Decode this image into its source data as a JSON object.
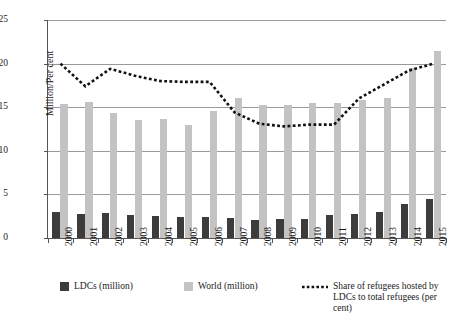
{
  "chart_data": {
    "type": "bar",
    "title": "",
    "xlabel": "",
    "ylabel": "Million/Per cent",
    "ylim": [
      0,
      25
    ],
    "yticks": [
      0,
      5,
      10,
      15,
      20,
      25
    ],
    "grid": true,
    "legend_position": "bottom",
    "categories": [
      "2000",
      "2001",
      "2002",
      "2003",
      "2004",
      "2005",
      "2006",
      "2007",
      "2008",
      "2009",
      "2010",
      "2011",
      "2012",
      "2013",
      "2014",
      "2015"
    ],
    "series": [
      {
        "name": "LDCs (million)",
        "type": "bar",
        "color": "#3c3c3c",
        "values": [
          3.0,
          2.8,
          2.9,
          2.6,
          2.5,
          2.4,
          2.4,
          2.3,
          2.1,
          2.2,
          2.2,
          2.6,
          2.8,
          3.0,
          3.9,
          4.5
        ]
      },
      {
        "name": "World (million)",
        "type": "bar",
        "color": "#c3c3c3",
        "values": [
          15.4,
          15.6,
          14.3,
          13.5,
          13.6,
          13.0,
          14.6,
          16.1,
          15.3,
          15.3,
          15.5,
          15.5,
          15.8,
          16.0,
          19.5,
          21.5
        ]
      },
      {
        "name": "Share of refugees hosted by LDCs to total refugees (per cent)",
        "type": "line",
        "style": "dotted",
        "color": "#111111",
        "values": [
          20.0,
          17.4,
          19.4,
          18.6,
          18.0,
          17.9,
          17.9,
          14.4,
          13.1,
          12.8,
          13.0,
          13.0,
          16.0,
          17.6,
          19.2,
          20.0
        ]
      }
    ],
    "legend": [
      {
        "label": "LDCs (million)",
        "marker": "square",
        "color": "#3c3c3c"
      },
      {
        "label": "World (million)",
        "marker": "square",
        "color": "#c3c3c3"
      },
      {
        "label": "Share of refugees hosted by\nLDCs to total refugees (per cent)",
        "marker": "dotted-line",
        "color": "#111111"
      }
    ]
  }
}
